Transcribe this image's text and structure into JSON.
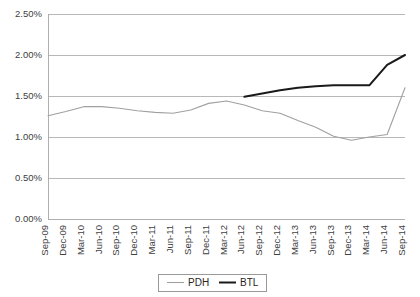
{
  "chart_data": {
    "type": "line",
    "title": "",
    "subtitle": "",
    "xlabel": "",
    "ylabel": "",
    "ylim": [
      0.0,
      2.5
    ],
    "ytick_values": [
      0.0,
      0.5,
      1.0,
      1.5,
      2.0,
      2.5
    ],
    "ytick_labels": [
      "0.00%",
      "0.50%",
      "1.00%",
      "1.50%",
      "2.00%",
      "2.50%"
    ],
    "grid": true,
    "legend_position": "bottom-center",
    "categories": [
      "Sep-09",
      "Dec-09",
      "Mar-10",
      "Jun-10",
      "Sep-10",
      "Dec-10",
      "Mar-11",
      "Jun-11",
      "Sep-11",
      "Dec-11",
      "Mar-12",
      "Jun-12",
      "Sep-12",
      "Dec-12",
      "Mar-13",
      "Jun-13",
      "Sep-13",
      "Dec-13",
      "Mar-14",
      "Jun-14",
      "Sep-14"
    ],
    "series": [
      {
        "name": "PDH",
        "color": "#a0a0a0",
        "values": [
          1.26,
          1.31,
          1.37,
          1.37,
          1.35,
          1.32,
          1.3,
          1.29,
          1.35,
          1.41,
          1.44,
          1.39,
          1.32,
          1.29,
          1.2,
          1.12,
          1.01,
          0.96,
          0.99,
          1.03,
          1.02
        ],
        "values_tail": [
          1.04,
          1.2,
          1.4,
          1.6
        ]
      },
      {
        "name": "BTL",
        "color": "#1a1a1a",
        "values": [
          null,
          null,
          null,
          null,
          null,
          null,
          null,
          null,
          null,
          null,
          null,
          1.49,
          1.53,
          1.57,
          1.6,
          1.62,
          1.63,
          1.63,
          1.62,
          1.78,
          1.9
        ],
        "values_tail": [
          1.96,
          2.0
        ]
      }
    ],
    "pdh_points": [
      [
        0,
        1.26
      ],
      [
        1,
        1.31
      ],
      [
        2,
        1.37
      ],
      [
        3,
        1.37
      ],
      [
        4,
        1.35
      ],
      [
        5,
        1.32
      ],
      [
        6,
        1.3
      ],
      [
        7,
        1.29
      ],
      [
        8,
        1.33
      ],
      [
        9,
        1.41
      ],
      [
        10,
        1.44
      ],
      [
        11,
        1.39
      ],
      [
        12,
        1.32
      ],
      [
        13,
        1.29
      ],
      [
        14,
        1.2
      ],
      [
        15,
        1.12
      ],
      [
        16,
        1.01
      ],
      [
        17,
        0.96
      ],
      [
        18,
        1.0
      ],
      [
        19,
        1.03
      ],
      [
        20,
        1.6
      ]
    ],
    "btl_points": [
      [
        11,
        1.49
      ],
      [
        12,
        1.53
      ],
      [
        13,
        1.57
      ],
      [
        14,
        1.6
      ],
      [
        15,
        1.62
      ],
      [
        16,
        1.63
      ],
      [
        17,
        1.63
      ],
      [
        18,
        1.63
      ],
      [
        19,
        1.88
      ],
      [
        20,
        2.0
      ]
    ],
    "annotations": []
  },
  "legend": {
    "items": [
      {
        "label": "PDH",
        "color": "#a0a0a0",
        "width": 1.1
      },
      {
        "label": "BTL",
        "color": "#1a1a1a",
        "width": 2.0
      }
    ]
  },
  "colors": {
    "background": "#ffffff",
    "grid": "#a6a6a6",
    "text": "#404040",
    "pdh": "#a0a0a0",
    "btl": "#1a1a1a"
  }
}
